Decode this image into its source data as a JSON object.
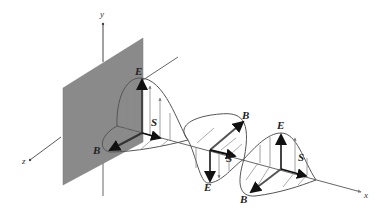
{
  "figure": {
    "type": "electromagnetic-wave-diagram",
    "axes": {
      "x": "x",
      "y": "y",
      "z": "z"
    },
    "field_labels": {
      "E_top": "E",
      "E_right": "E",
      "E_bottom": "E",
      "B_left": "B",
      "B_upper": "B",
      "B_lower": "B",
      "S_first": "S",
      "S_second": "S",
      "S_third": "S"
    },
    "colors": {
      "plate": "#8a8a8a",
      "curve": "#555555",
      "vector_bold": "#111111",
      "vector_light": "#888888",
      "axis": "#444444"
    }
  }
}
